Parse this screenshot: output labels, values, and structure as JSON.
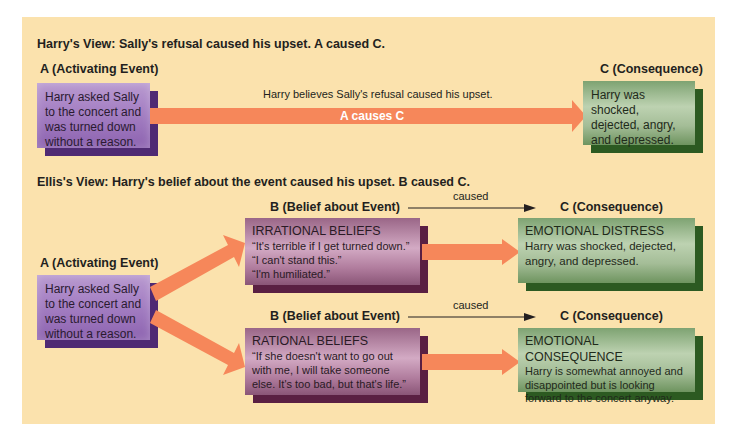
{
  "colors": {
    "panel_bg": "#fbe2ad",
    "arrow": "#f6875a",
    "activating_box": "#a985c6",
    "belief_box": "#b07c9d",
    "consequence_box": "#a4bd97"
  },
  "harry_view": {
    "heading": "Harry's View: Sally's refusal caused his upset. A caused C.",
    "a_label": "A (Activating Event)",
    "a_text": "Harry asked Sally to the concert and was turned down without a reason.",
    "arrow_caption": "Harry believes Sally's refusal caused his upset.",
    "arrow_label": "A causes C",
    "c_label": "C (Consequence)",
    "c_text": "Harry was shocked, dejected, angry, and depressed."
  },
  "ellis_view": {
    "heading": "Ellis's View: Harry's belief about the event caused his upset. B caused C.",
    "a_label": "A (Activating Event)",
    "a_text": "Harry asked Sally to the concert and was turned down without a reason.",
    "rows": [
      {
        "b_label": "B (Belief about Event)",
        "caused": "caused",
        "c_label": "C (Consequence)",
        "b_title": "IRRATIONAL BELIEFS",
        "b_lines": [
          "“It's terrible if I get turned down.”",
          "“I can't stand this.”",
          "“I'm humiliated.”"
        ],
        "c_title": "EMOTIONAL DISTRESS",
        "c_text": "Harry was shocked, dejected, angry, and depressed."
      },
      {
        "b_label": "B (Belief about Event)",
        "caused": "caused",
        "c_label": "C (Consequence)",
        "b_title": "RATIONAL BELIEFS",
        "b_lines": [
          "“If she doesn't want to go out",
          "with me, I will take someone",
          "else. It's too bad, but that's life.”"
        ],
        "c_title": "EMOTIONAL CONSEQUENCE",
        "c_text": "Harry is somewhat annoyed and disappointed but is looking forward to the concert anyway."
      }
    ]
  }
}
